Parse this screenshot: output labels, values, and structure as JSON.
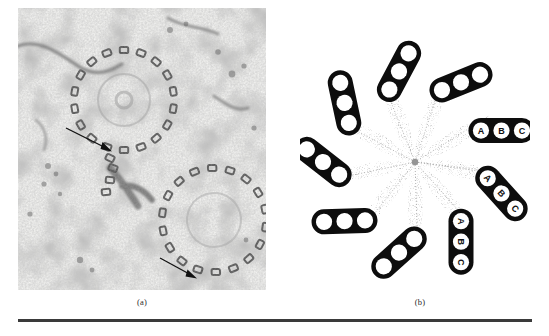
{
  "figure": {
    "panel_a": {
      "caption": "(a)",
      "kind": "electron-micrograph",
      "description": "Transmission electron micrograph of two centriole cross-sections showing cartwheel of triplet microtubules",
      "arrows": [
        {
          "id": "arrow-upper",
          "x1": 66,
          "y1": 128,
          "x2": 111,
          "y2": 149
        },
        {
          "id": "arrow-lower",
          "x1": 160,
          "y1": 258,
          "x2": 196,
          "y2": 277
        }
      ],
      "centrioles": [
        {
          "id": "centriole-upper-left",
          "cx": 106,
          "cy": 92,
          "r": 52
        },
        {
          "id": "centriole-lower-right",
          "cx": 196,
          "cy": 212,
          "r": 55
        }
      ]
    },
    "panel_b": {
      "caption": "(b)",
      "kind": "schematic-diagram",
      "description": "Schematic cross-section of a centriole: nine triplet microtubules arranged in a pinwheel around a central hub",
      "triplet_count": 9,
      "tubule_labels": [
        "A",
        "B",
        "C"
      ],
      "labeled_triplets": [
        {
          "id": "triplet-right-upper",
          "angle_deg": 340,
          "labels": [
            "A",
            "B",
            "C"
          ]
        },
        {
          "id": "triplet-right-middle",
          "angle_deg": 20,
          "labels": [
            "A",
            "B",
            "C"
          ]
        },
        {
          "id": "triplet-right-lower",
          "angle_deg": 60,
          "labels": [
            "A",
            "B",
            "C"
          ]
        }
      ],
      "unlabeled_triplets": [
        {
          "id": "triplet-top-right",
          "angle_deg": 300
        },
        {
          "id": "triplet-top-left",
          "angle_deg": 260
        },
        {
          "id": "triplet-left-upper",
          "angle_deg": 220
        },
        {
          "id": "triplet-left-lower",
          "angle_deg": 180
        },
        {
          "id": "triplet-bottom-left",
          "angle_deg": 140
        },
        {
          "id": "triplet-bottom-right",
          "angle_deg": 100
        }
      ]
    }
  },
  "colors": {
    "ink": "#101010",
    "rule": "#3a3a3a",
    "caption": "#2a2a2a",
    "stipple": "#7a7a7a",
    "micrograph_light": "#f4f4f2",
    "micrograph_dark": "#4a4a4a"
  }
}
